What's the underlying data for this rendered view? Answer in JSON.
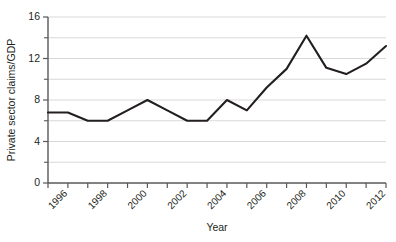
{
  "chart_data": {
    "type": "line",
    "title": "",
    "xlabel": "Year",
    "ylabel": "Private sector claims/GDP",
    "x": [
      1995,
      1996,
      1997,
      1998,
      1999,
      2000,
      2001,
      2002,
      2003,
      2004,
      2005,
      2006,
      2007,
      2008,
      2009,
      2010,
      2011,
      2012
    ],
    "values": [
      6.8,
      6.8,
      6.0,
      6.0,
      7.0,
      8.0,
      7.0,
      6.0,
      6.0,
      8.0,
      7.0,
      9.2,
      11.0,
      14.2,
      11.1,
      10.5,
      11.5,
      13.2
    ],
    "series": [
      {
        "name": "Private sector claims/GDP",
        "values": [
          6.8,
          6.8,
          6.0,
          6.0,
          7.0,
          8.0,
          7.0,
          6.0,
          6.0,
          8.0,
          7.0,
          9.2,
          11.0,
          14.2,
          11.1,
          10.5,
          11.5,
          13.2
        ],
        "color": "#231f20"
      }
    ],
    "xlim": [
      1995,
      2012
    ],
    "ylim": [
      0,
      16
    ],
    "ytick_labels": [
      "0",
      "4",
      "8",
      "12",
      "16"
    ],
    "ytick_values": [
      0,
      4,
      8,
      12,
      16
    ],
    "yminor_values": [
      2,
      6,
      10,
      14
    ],
    "gridline_values": [
      2,
      4,
      6,
      8,
      10,
      12,
      14,
      16
    ],
    "xtick_values": [
      1995,
      1996,
      1997,
      1998,
      1999,
      2000,
      2001,
      2002,
      2003,
      2004,
      2005,
      2006,
      2007,
      2008,
      2009,
      2010,
      2011,
      2012
    ],
    "xtick_labels": [
      "1996",
      "1998",
      "2000",
      "2002",
      "2004",
      "2006",
      "2008",
      "2010",
      "2012"
    ],
    "xtick_label_values": [
      1996,
      1998,
      2000,
      2002,
      2004,
      2006,
      2008,
      2010,
      2012
    ],
    "grid": true,
    "legend": "none",
    "line_color": "#231f20",
    "grid_color": "#d9d9da",
    "axis_color": "#58585a",
    "background": "#ffffff"
  }
}
